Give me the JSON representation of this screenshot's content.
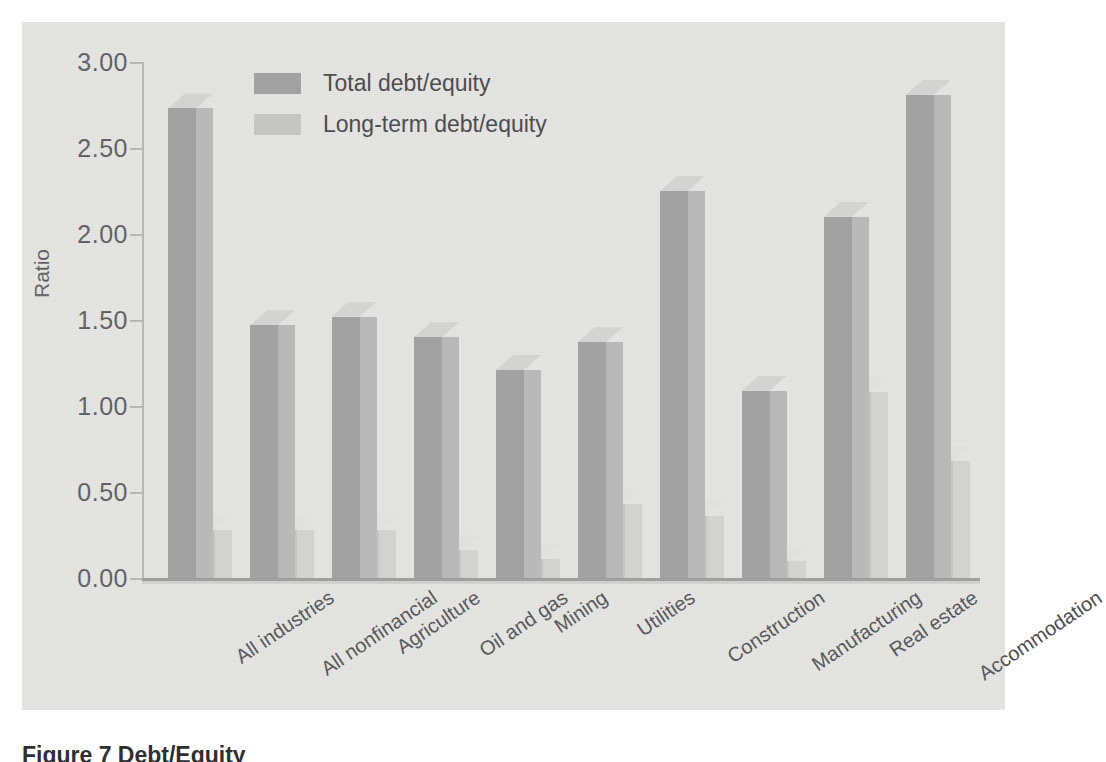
{
  "chart_data": {
    "type": "bar",
    "title": "",
    "xlabel": "",
    "ylabel": "Ratio",
    "ylim": [
      0.0,
      3.0
    ],
    "ytick_labels": [
      "0.00",
      "0.50",
      "1.00",
      "1.50",
      "2.00",
      "2.50",
      "3.00"
    ],
    "ytick_values": [
      0.0,
      0.5,
      1.0,
      1.5,
      2.0,
      2.5,
      3.0
    ],
    "grid": false,
    "legend_position": "top-left-inside",
    "style": "3d-grouped-bars",
    "categories": [
      "All industries",
      "All nonfinancial",
      "Agriculture",
      "Oil and gas",
      "Mining",
      "Utilities",
      "Construction",
      "Manufacturing",
      "Real estate",
      "Accommodation"
    ],
    "series": [
      {
        "name": "Total debt/equity",
        "color": "#a2a2a2",
        "values": [
          2.73,
          1.47,
          1.52,
          1.4,
          1.21,
          1.37,
          2.25,
          1.09,
          2.1,
          2.81
        ]
      },
      {
        "name": "Long-term debt/equity",
        "color": "#c5c5c3",
        "values": [
          0.28,
          0.28,
          0.28,
          0.16,
          0.11,
          0.43,
          0.36,
          0.1,
          1.08,
          0.68
        ]
      }
    ]
  },
  "legend": {
    "items": [
      {
        "label": "Total debt/equity",
        "swatch_class": "total"
      },
      {
        "label": "Long-term debt/equity",
        "swatch_class": "long"
      }
    ]
  },
  "caption": {
    "text": "Figure 7  Debt/Equity"
  },
  "colors": {
    "panel_background": "#e3e3e1",
    "series_total": "#a2a2a2",
    "series_long_term": "#c5c5c3",
    "axis": "#b4b4b2",
    "text": "#4d4d4f"
  }
}
